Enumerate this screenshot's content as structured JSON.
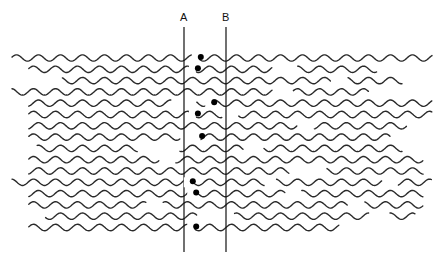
{
  "diagram": {
    "title": "",
    "markers": [
      {
        "id": "A",
        "label": "A"
      },
      {
        "id": "B",
        "label": "B"
      }
    ],
    "strand_color": "#2a2a2a",
    "dot_color": "#000000",
    "line_color": "#111111",
    "rows": [
      {
        "segments": [
          [
            0.0,
            1.0
          ]
        ],
        "breaks_right": [
          [
            0.69,
            0.71
          ]
        ],
        "dot": 0.4
      },
      {
        "segments": [
          [
            0.04,
            0.62
          ],
          [
            0.68,
            0.87
          ]
        ],
        "dot": 0.33
      },
      {
        "segments": [
          [
            0.12,
            0.76
          ],
          [
            0.8,
            0.93
          ]
        ],
        "dot": null
      },
      {
        "segments": [
          [
            0.0,
            0.62
          ],
          [
            0.67,
            0.85
          ]
        ],
        "dot": null
      },
      {
        "segments": [
          [
            0.04,
            0.38
          ],
          [
            0.44,
            1.0
          ]
        ],
        "dot": 0.72
      },
      {
        "segments": [
          [
            0.04,
            0.5
          ],
          [
            0.54,
            1.0
          ]
        ],
        "dot": 0.33
      },
      {
        "segments": [
          [
            0.04,
            0.68
          ],
          [
            0.72,
            0.94
          ]
        ],
        "dot": null
      },
      {
        "segments": [
          [
            0.04,
            0.4
          ],
          [
            0.45,
            0.9
          ]
        ],
        "dot": 0.43
      },
      {
        "segments": [
          [
            0.06,
            0.3
          ],
          [
            0.4,
            0.55
          ],
          [
            0.6,
            0.93
          ]
        ],
        "dot": null
      },
      {
        "segments": [
          [
            0.04,
            0.35
          ],
          [
            0.39,
            0.98
          ]
        ],
        "dot": null
      },
      {
        "segments": [
          [
            0.04,
            0.66
          ],
          [
            0.75,
            0.98
          ]
        ],
        "dot": null
      },
      {
        "segments": [
          [
            0.0,
            0.6
          ],
          [
            0.63,
            0.88
          ],
          [
            0.92,
            1.0
          ]
        ],
        "dot": 0.21
      },
      {
        "segments": [
          [
            0.04,
            0.65
          ],
          [
            0.69,
            0.98
          ]
        ],
        "dot": 0.29
      },
      {
        "segments": [
          [
            0.04,
            0.32
          ],
          [
            0.36,
            0.8
          ],
          [
            0.84,
            0.98
          ]
        ],
        "dot": null
      },
      {
        "segments": [
          [
            0.08,
            0.44
          ],
          [
            0.53,
            0.85
          ],
          [
            0.9,
            0.96
          ]
        ],
        "dot": null
      },
      {
        "segments": [
          [
            0.04,
            0.78
          ]
        ],
        "dot": 0.29
      }
    ]
  }
}
